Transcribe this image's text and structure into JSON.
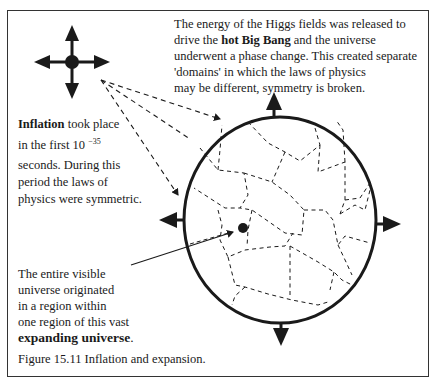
{
  "figure": {
    "caption": "Figure 15.11 Inflation and expansion.",
    "top_right_text": {
      "line1": "The energy of the Higgs fields was released to",
      "line2_pre": "drive the ",
      "line2_bold": "hot Big Bang",
      "line2_post": " and the universe",
      "line3": "underwent a phase change. This created separate",
      "line4": "'domains' in which the laws of physics",
      "line5": "may be different, symmetry is broken."
    },
    "left_text": {
      "line1_bold": "Inflation",
      "line1_post": " took place",
      "line2": "in the first 10 ",
      "exponent": "−35",
      "line3": "seconds. During this",
      "line4": "period the laws of",
      "line5": "physics were symmetric."
    },
    "bottom_left_text": {
      "line1": "The entire visible",
      "line2": "universe originated",
      "line3": "in a region within",
      "line4": "one region of this vast",
      "line5_bold": "expanding universe",
      "line5_post": "."
    },
    "colors": {
      "ink": "#1a1a1a",
      "frame": "#333333",
      "background": "#ffffff"
    },
    "icons": {
      "small_cross": "four-way-expansion-arrows-icon",
      "circle_arrows": "expansion-arrows-icon",
      "point": "visible-universe-dot-icon"
    }
  }
}
